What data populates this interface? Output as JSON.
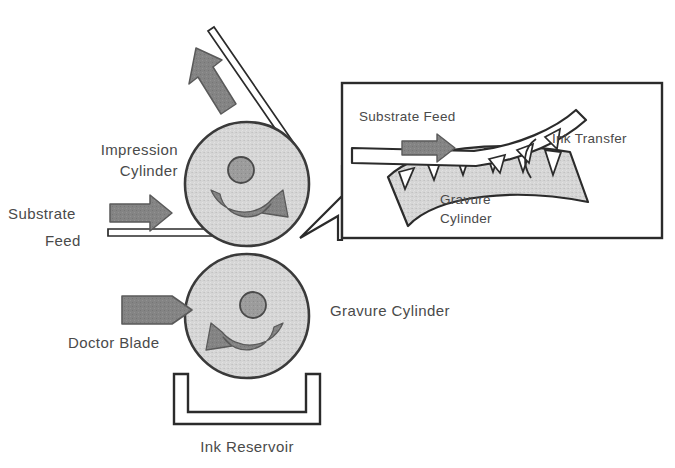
{
  "diagram": {
    "type": "process-schematic",
    "canvas": {
      "width": 675,
      "height": 468
    },
    "colors": {
      "background": "#ffffff",
      "cylinder_fill": "#d4d4d4",
      "cylinder_stroke": "#404040",
      "hub_fill": "#9a9a9a",
      "arrow_gray": "#808080",
      "arrow_stroke": "#5a5a5a",
      "line_dark": "#2b2b2b",
      "text": "#4a4a4a"
    },
    "main_view": {
      "labels": {
        "impression_cylinder_line1": "Impression",
        "impression_cylinder_line2": "Cylinder",
        "substrate_feed_line1": "Substrate",
        "substrate_feed_line2": "Feed",
        "doctor_blade": "Doctor Blade",
        "gravure_cylinder": "Gravure Cylinder",
        "ink_reservoir": "Ink Reservoir"
      },
      "components": [
        {
          "name": "impression-cylinder",
          "shape": "circle",
          "cx": 247,
          "cy": 184,
          "r": 62,
          "rotation": "clockwise"
        },
        {
          "name": "gravure-cylinder",
          "shape": "circle",
          "cx": 247,
          "cy": 316,
          "r": 62,
          "rotation": "counter-clockwise"
        },
        {
          "name": "ink-reservoir",
          "shape": "open-trough"
        },
        {
          "name": "doctor-blade",
          "shape": "wedge-arrow",
          "direction": "right"
        },
        {
          "name": "substrate-web",
          "shape": "thin-band"
        }
      ],
      "arrows": [
        {
          "name": "substrate-feed-arrow",
          "direction": "right"
        },
        {
          "name": "substrate-exit-arrow",
          "direction": "up-left"
        },
        {
          "name": "impression-rotation-arrow",
          "direction": "clockwise"
        },
        {
          "name": "gravure-rotation-arrow",
          "direction": "counter-clockwise"
        }
      ]
    },
    "inset_detail": {
      "box": {
        "x": 342,
        "y": 83,
        "width": 320,
        "height": 155
      },
      "labels": {
        "substrate_feed": "Substrate Feed",
        "ink_transfer": "Ink Transfer",
        "gravure_cylinder_line1": "Gravure",
        "gravure_cylinder_line2": "Cylinder"
      },
      "components": [
        {
          "name": "substrate-band",
          "shape": "curved-band"
        },
        {
          "name": "gravure-cylinder-surface",
          "shape": "curved-segment"
        },
        {
          "name": "engraved-cells",
          "shape": "triangular-cells",
          "count_on_cylinder": 6,
          "count_on_substrate": 3
        }
      ],
      "callout_target": "nip between impression and gravure cylinders"
    }
  }
}
